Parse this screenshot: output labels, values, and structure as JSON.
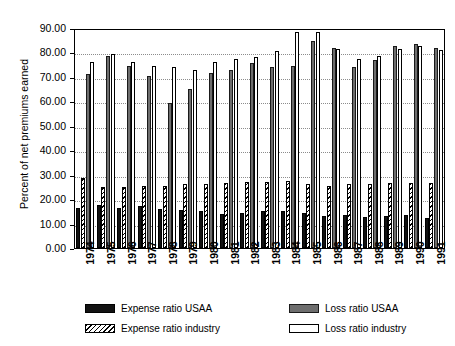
{
  "chart_data": {
    "type": "bar",
    "title": "",
    "xlabel": "",
    "ylabel": "Percent of net premiums earned",
    "ylim": [
      0,
      90
    ],
    "ytick_step": 10,
    "ytick_labels": [
      "90.00",
      "80.00",
      "70.00",
      "60.00",
      "50.00",
      "40.00",
      "30.00",
      "20.00",
      "10.00",
      "0.00"
    ],
    "grid": true,
    "legend_position": "bottom",
    "categories": [
      "1974",
      "1975",
      "1976",
      "1977",
      "1978",
      "1979",
      "1980",
      "1981",
      "1982",
      "1983",
      "1984",
      "1985",
      "1986",
      "1987",
      "1988",
      "1989",
      "1990",
      "1991"
    ],
    "series": [
      {
        "name": "Expense ratio USAA",
        "color": "#121212",
        "pattern": "solid-black",
        "values": [
          16.5,
          17.8,
          16.3,
          17.2,
          16.0,
          15.5,
          15.0,
          14.0,
          14.2,
          15.0,
          15.3,
          14.5,
          13.2,
          13.6,
          12.7,
          13.0,
          13.4,
          12.2
        ]
      },
      {
        "name": "Loss ratio USAA",
        "color": "#6e6e6e",
        "pattern": "solid-gray",
        "values": [
          71.0,
          78.5,
          74.5,
          70.5,
          59.5,
          65.0,
          71.5,
          73.0,
          75.5,
          74.0,
          74.5,
          84.5,
          82.0,
          74.0,
          77.0,
          82.5,
          83.5,
          82.0
        ]
      },
      {
        "name": "Expense ratio industry",
        "color": "#ffffff",
        "pattern": "diagonal-hatch",
        "values": [
          28.5,
          25.0,
          25.0,
          25.3,
          25.5,
          26.0,
          26.3,
          26.5,
          27.0,
          27.2,
          27.5,
          26.0,
          25.5,
          26.0,
          26.3,
          26.5,
          26.5,
          26.8
        ]
      },
      {
        "name": "Loss ratio industry",
        "color": "#ffffff",
        "pattern": "open-white",
        "values": [
          76.0,
          79.5,
          76.0,
          74.5,
          74.0,
          73.0,
          76.0,
          77.5,
          78.0,
          80.5,
          88.5,
          88.5,
          81.5,
          77.5,
          78.5,
          81.5,
          82.5,
          81.0
        ]
      }
    ]
  },
  "legend": {
    "items": [
      {
        "label": "Expense ratio USAA"
      },
      {
        "label": "Expense ratio industry"
      },
      {
        "label": "Loss ratio USAA"
      },
      {
        "label": "Loss ratio industry"
      }
    ]
  }
}
